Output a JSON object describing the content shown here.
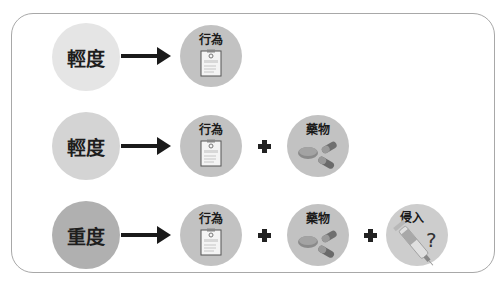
{
  "rows": [
    {
      "level": "輕度",
      "level_color": "#e5e5e5",
      "items": [
        "行為"
      ]
    },
    {
      "level": "輕度",
      "level_color": "#d4d4d4",
      "items": [
        "行為",
        "藥物"
      ]
    },
    {
      "level": "重度",
      "level_color": "#b0b0b0",
      "items": [
        "行為",
        "藥物",
        "侵入"
      ]
    }
  ],
  "icons": {
    "behavior": "clipboard-icon",
    "medication": "pills-icon",
    "invasive": "syringe-question-icon"
  },
  "invasive_mark": "?",
  "colors": {
    "item_circle": "#c2c2c2",
    "frame_border": "#a8a8a8",
    "arrow": "#1a1a1a"
  }
}
